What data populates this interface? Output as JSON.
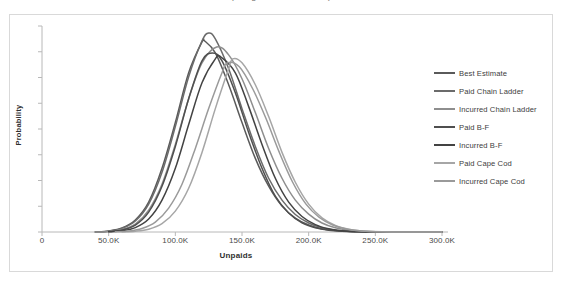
{
  "chart_data": {
    "type": "line",
    "title": "(using various methods)",
    "xlabel": "Unpaids",
    "ylabel": "Probability",
    "xlim": [
      0,
      300000
    ],
    "ylim": [
      0,
      1
    ],
    "grid": false,
    "legend_position": "right",
    "x_tick_labels": [
      "0",
      "50.0K",
      "100.0K",
      "150.0K",
      "200.0K",
      "250.0K",
      "300.0K"
    ],
    "x_tick_values": [
      0,
      50000,
      100000,
      150000,
      200000,
      250000,
      300000
    ],
    "y_tick_labels": [
      "",
      "",
      "",
      "",
      "",
      "",
      "",
      "",
      ""
    ],
    "y_tick_count": 9,
    "series": [
      {
        "name": "Best Estimate",
        "color": "#5a5a5a",
        "mean": 122000,
        "sigma": 26000,
        "peak": 0.96,
        "x": [
          40000,
          50000,
          60000,
          70000,
          80000,
          90000,
          100000,
          110000,
          120000,
          122000,
          130000,
          140000,
          150000,
          160000,
          170000,
          180000,
          190000,
          200000,
          210000,
          220000,
          230000,
          240000,
          250000,
          260000,
          280000,
          300000
        ],
        "y": [
          0.0,
          0.005,
          0.02,
          0.06,
          0.15,
          0.32,
          0.55,
          0.8,
          0.955,
          0.96,
          0.9,
          0.74,
          0.55,
          0.37,
          0.23,
          0.13,
          0.07,
          0.035,
          0.016,
          0.007,
          0.003,
          0.001,
          0.0005,
          0.0,
          0.0,
          0.0
        ]
      },
      {
        "name": "Paid Chain Ladder",
        "color": "#6b6b6b",
        "mean": 125000,
        "sigma": 28000,
        "peak": 1.0,
        "x": [
          40000,
          50000,
          60000,
          70000,
          80000,
          90000,
          100000,
          110000,
          120000,
          125000,
          130000,
          140000,
          150000,
          160000,
          170000,
          180000,
          190000,
          200000,
          210000,
          220000,
          230000,
          240000,
          250000,
          260000,
          280000,
          300000
        ],
        "y": [
          0.0,
          0.004,
          0.018,
          0.055,
          0.14,
          0.3,
          0.53,
          0.78,
          0.96,
          1.0,
          0.97,
          0.82,
          0.62,
          0.43,
          0.27,
          0.16,
          0.088,
          0.045,
          0.021,
          0.009,
          0.004,
          0.0015,
          0.0006,
          0.0,
          0.0,
          0.0
        ]
      },
      {
        "name": "Incurred Chain Ladder",
        "color": "#8e8e8e",
        "mean": 131000,
        "sigma": 30000,
        "peak": 0.93,
        "x": [
          40000,
          50000,
          60000,
          70000,
          80000,
          90000,
          100000,
          110000,
          120000,
          131000,
          140000,
          150000,
          160000,
          170000,
          180000,
          190000,
          200000,
          210000,
          220000,
          230000,
          240000,
          250000,
          260000,
          280000,
          300000
        ],
        "y": [
          0.0,
          0.003,
          0.013,
          0.04,
          0.11,
          0.24,
          0.44,
          0.67,
          0.85,
          0.93,
          0.89,
          0.77,
          0.6,
          0.42,
          0.27,
          0.16,
          0.09,
          0.045,
          0.021,
          0.009,
          0.004,
          0.0015,
          0.0005,
          0.0,
          0.0
        ]
      },
      {
        "name": "Paid B-F",
        "color": "#4f4f4f",
        "mean": 128000,
        "sigma": 24000,
        "peak": 0.9,
        "x": [
          50000,
          60000,
          70000,
          80000,
          90000,
          100000,
          110000,
          120000,
          128000,
          135000,
          145000,
          155000,
          165000,
          175000,
          185000,
          195000,
          205000,
          215000,
          225000,
          235000,
          250000,
          270000,
          300000
        ],
        "y": [
          0.002,
          0.01,
          0.035,
          0.1,
          0.23,
          0.43,
          0.67,
          0.86,
          0.9,
          0.86,
          0.7,
          0.5,
          0.32,
          0.18,
          0.095,
          0.046,
          0.021,
          0.009,
          0.0035,
          0.0013,
          0.0003,
          0.0,
          0.0
        ]
      },
      {
        "name": "Incurred B-F",
        "color": "#434343",
        "mean": 134000,
        "sigma": 27000,
        "peak": 0.88,
        "x": [
          50000,
          60000,
          70000,
          80000,
          90000,
          100000,
          110000,
          120000,
          130000,
          134000,
          145000,
          155000,
          165000,
          175000,
          185000,
          195000,
          205000,
          215000,
          225000,
          235000,
          250000,
          270000,
          300000
        ],
        "y": [
          0.001,
          0.006,
          0.022,
          0.065,
          0.16,
          0.32,
          0.54,
          0.75,
          0.87,
          0.88,
          0.8,
          0.63,
          0.44,
          0.27,
          0.15,
          0.078,
          0.037,
          0.016,
          0.0065,
          0.0025,
          0.0006,
          0.0,
          0.0
        ]
      },
      {
        "name": "Paid Cape Cod",
        "color": "#a6a6a6",
        "mean": 143000,
        "sigma": 26000,
        "peak": 0.87,
        "x": [
          60000,
          70000,
          80000,
          90000,
          100000,
          110000,
          120000,
          130000,
          140000,
          143000,
          150000,
          160000,
          170000,
          180000,
          190000,
          200000,
          210000,
          220000,
          230000,
          240000,
          255000,
          275000,
          300000
        ],
        "y": [
          0.001,
          0.004,
          0.014,
          0.042,
          0.105,
          0.22,
          0.4,
          0.62,
          0.82,
          0.87,
          0.85,
          0.74,
          0.58,
          0.4,
          0.25,
          0.14,
          0.071,
          0.033,
          0.014,
          0.0055,
          0.0012,
          0.0,
          0.0
        ]
      },
      {
        "name": "Incurred Cape Cod",
        "color": "#9a9a9a",
        "mean": 139000,
        "sigma": 29000,
        "peak": 0.85,
        "x": [
          55000,
          65000,
          75000,
          85000,
          95000,
          105000,
          115000,
          125000,
          135000,
          139000,
          148000,
          158000,
          168000,
          178000,
          188000,
          198000,
          208000,
          218000,
          228000,
          240000,
          255000,
          275000,
          300000
        ],
        "y": [
          0.001,
          0.005,
          0.018,
          0.05,
          0.12,
          0.24,
          0.42,
          0.62,
          0.8,
          0.85,
          0.83,
          0.72,
          0.57,
          0.4,
          0.25,
          0.14,
          0.073,
          0.035,
          0.015,
          0.005,
          0.0012,
          0.0,
          0.0
        ]
      }
    ]
  },
  "legend": {
    "items": [
      {
        "label": "Best Estimate",
        "color": "#5a5a5a"
      },
      {
        "label": "Paid Chain Ladder",
        "color": "#6b6b6b"
      },
      {
        "label": "Incurred Chain Ladder",
        "color": "#8e8e8e"
      },
      {
        "label": "Paid B-F",
        "color": "#4f4f4f"
      },
      {
        "label": "Incurred B-F",
        "color": "#434343"
      },
      {
        "label": "Paid Cape Cod",
        "color": "#a6a6a6"
      },
      {
        "label": "Incurred Cape Cod",
        "color": "#9a9a9a"
      }
    ]
  },
  "axes": {
    "x_title": "Unpaids",
    "y_title": "Probability",
    "x_ticks": [
      "0",
      "50.0K",
      "100.0K",
      "150.0K",
      "200.0K",
      "250.0K",
      "300.0K"
    ]
  },
  "title": "(using various methods)",
  "colors": {
    "axis": "#b8b8b8",
    "frame": "#d9d9d9",
    "text": "#3d3d3d",
    "background": "#ffffff"
  }
}
